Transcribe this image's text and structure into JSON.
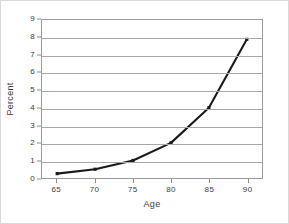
{
  "chart_data": {
    "type": "line",
    "title": "",
    "xlabel": "Age",
    "ylabel": "Percent",
    "x": [
      65,
      70,
      75,
      80,
      85,
      90
    ],
    "values": [
      0.25,
      0.5,
      1.0,
      2.0,
      4.0,
      7.9
    ],
    "series": [
      {
        "name": "Percent",
        "values": [
          0.25,
          0.5,
          1.0,
          2.0,
          4.0,
          7.9
        ]
      }
    ],
    "xlim": [
      63,
      92
    ],
    "ylim": [
      0,
      9
    ],
    "x_ticks": [
      "65",
      "70",
      "75",
      "80",
      "85",
      "90"
    ],
    "y_ticks": [
      "0",
      "1",
      "2",
      "3",
      "4",
      "5",
      "6",
      "7",
      "8",
      "9"
    ],
    "grid": "horizontal",
    "legend": "none",
    "marker": "square",
    "line_color": "#1a1a1a",
    "grid_color": "#a8a8a8",
    "axis_color": "#9a9a9a",
    "background": "#ffffff"
  }
}
